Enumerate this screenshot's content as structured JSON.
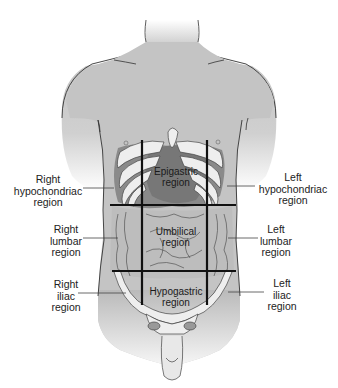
{
  "diagram": {
    "colors": {
      "skin": "#c4c4c4",
      "skin_shadow": "#a9a9a9",
      "organ_dark": "#7d7d7d",
      "organ_mid": "#9a9a9a",
      "bone": "#eeeeee",
      "outline": "#333333",
      "grid_line": "#111111",
      "label_text": "#222222",
      "leader_line": "#444444"
    },
    "grid": {
      "vertical_x": [
        142,
        207
      ],
      "horizontal_y": [
        205,
        271
      ]
    },
    "regions_inner": [
      {
        "id": "epigastric",
        "lines": [
          "Epigastric",
          "region"
        ]
      },
      {
        "id": "umbilical",
        "lines": [
          "Umbilical",
          "region"
        ]
      },
      {
        "id": "hypogastric",
        "lines": [
          "Hypogastric",
          "region"
        ]
      }
    ],
    "labels_left": [
      {
        "id": "right-hypochondriac",
        "lines": [
          "Right",
          "hypochondriac",
          "region"
        ]
      },
      {
        "id": "right-lumbar",
        "lines": [
          "Right",
          "lumbar",
          "region"
        ]
      },
      {
        "id": "right-iliac",
        "lines": [
          "Right",
          "iliac",
          "region"
        ]
      }
    ],
    "labels_right": [
      {
        "id": "left-hypochondriac",
        "lines": [
          "Left",
          "hypochondriac",
          "region"
        ]
      },
      {
        "id": "left-lumbar",
        "lines": [
          "Left",
          "lumbar",
          "region"
        ]
      },
      {
        "id": "left-iliac",
        "lines": [
          "Left",
          "iliac",
          "region"
        ]
      }
    ]
  }
}
